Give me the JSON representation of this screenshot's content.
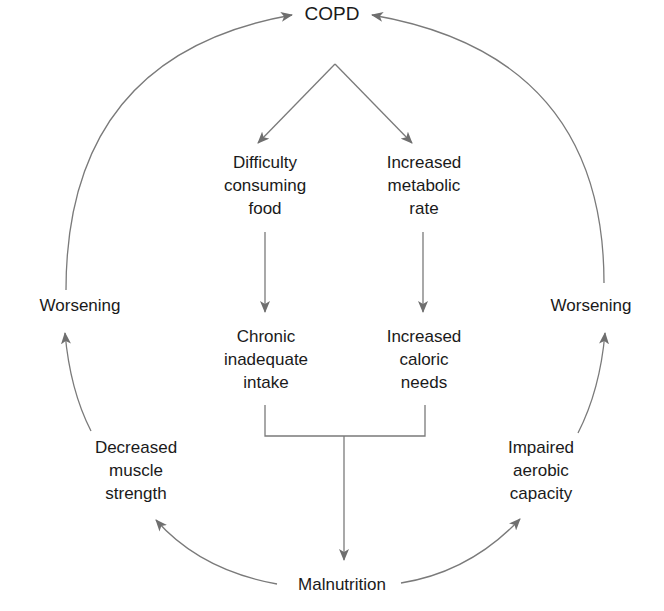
{
  "diagram": {
    "type": "flow-cycle",
    "colors": {
      "text": "#1a1a1a",
      "line": "#6f6f6f",
      "background": "#ffffff"
    },
    "nodes": {
      "copd": {
        "lines": [
          "COPD"
        ]
      },
      "difficulty": {
        "lines": [
          "Difficulty",
          "consuming",
          "food"
        ]
      },
      "metabolic": {
        "lines": [
          "Increased",
          "metabolic",
          "rate"
        ]
      },
      "chronic": {
        "lines": [
          "Chronic",
          "inadequate",
          "intake"
        ]
      },
      "caloric": {
        "lines": [
          "Increased",
          "caloric",
          "needs"
        ]
      },
      "malnutrition": {
        "lines": [
          "Malnutrition"
        ]
      },
      "muscle": {
        "lines": [
          "Decreased",
          "muscle",
          "strength"
        ]
      },
      "aerobic": {
        "lines": [
          "Impaired",
          "aerobic",
          "capacity"
        ]
      },
      "worsening_left": {
        "lines": [
          "Worsening"
        ]
      },
      "worsening_right": {
        "lines": [
          "Worsening"
        ]
      }
    },
    "edges": [
      {
        "from": "COPD",
        "to": "Difficulty consuming food"
      },
      {
        "from": "COPD",
        "to": "Increased metabolic rate"
      },
      {
        "from": "Difficulty consuming food",
        "to": "Chronic inadequate intake"
      },
      {
        "from": "Increased metabolic rate",
        "to": "Increased caloric needs"
      },
      {
        "from": "Chronic inadequate intake + Increased caloric needs",
        "to": "Malnutrition"
      },
      {
        "from": "Malnutrition",
        "to": "Decreased muscle strength"
      },
      {
        "from": "Malnutrition",
        "to": "Impaired aerobic capacity"
      },
      {
        "from": "Decreased muscle strength",
        "to": "Worsening (left)"
      },
      {
        "from": "Impaired aerobic capacity",
        "to": "Worsening (right)"
      },
      {
        "from": "Worsening (left)",
        "to": "COPD"
      },
      {
        "from": "Worsening (right)",
        "to": "COPD"
      }
    ]
  }
}
